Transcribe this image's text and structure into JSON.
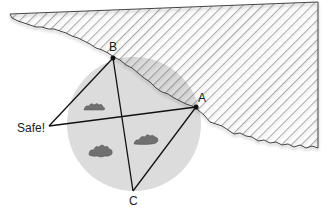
{
  "diagram": {
    "points": {
      "A": {
        "label": "A",
        "x": 196,
        "y": 107
      },
      "B": {
        "label": "B",
        "x": 113,
        "y": 58
      },
      "C": {
        "label": "C",
        "x": 133,
        "y": 191
      },
      "safe": {
        "label": "Safe!",
        "x": 49,
        "y": 126
      }
    },
    "colors": {
      "circle_fill": "#d9d9d9",
      "hatch_line": "#555555",
      "line": "#111111",
      "bush": "#6e6e6e"
    }
  }
}
